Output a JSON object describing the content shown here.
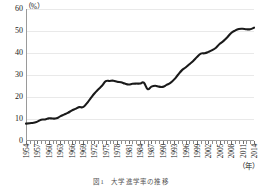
{
  "figure": {
    "unit_label": "（%）",
    "year_unit": "（年）",
    "caption": "図1　大学進学率の推移"
  },
  "chart_data": {
    "type": "line",
    "title": "図1　大学進学率の推移",
    "xlabel": "（年）",
    "ylabel": "（%）",
    "ylim": [
      0,
      60
    ],
    "xlim": [
      1954,
      2014
    ],
    "grid": true,
    "legend": "none",
    "yticks": [
      0,
      10,
      20,
      30,
      40,
      50,
      60
    ],
    "xtick_labels": [
      "1954",
      "1957",
      "1960",
      "1963",
      "1966",
      "1969",
      "1972",
      "1975",
      "1978",
      "1981",
      "1984",
      "1987",
      "1990",
      "1993",
      "1996",
      "1999",
      "2002",
      "2005",
      "2008",
      "2011",
      "2014"
    ],
    "line_color": "#1a1a1a",
    "x": [
      1954,
      1955,
      1956,
      1957,
      1958,
      1959,
      1960,
      1961,
      1962,
      1963,
      1964,
      1965,
      1966,
      1967,
      1968,
      1969,
      1970,
      1971,
      1972,
      1973,
      1974,
      1975,
      1976,
      1977,
      1978,
      1979,
      1980,
      1981,
      1982,
      1983,
      1984,
      1985,
      1986,
      1987,
      1988,
      1989,
      1990,
      1991,
      1992,
      1993,
      1994,
      1995,
      1996,
      1997,
      1998,
      1999,
      2000,
      2001,
      2002,
      2003,
      2004,
      2005,
      2006,
      2007,
      2008,
      2009,
      2010,
      2011,
      2012,
      2013,
      2014
    ],
    "values": [
      7.9,
      8.1,
      8.3,
      8.8,
      9.7,
      9.8,
      10.3,
      10.2,
      10.3,
      11.2,
      12.0,
      12.8,
      13.8,
      14.6,
      15.4,
      15.4,
      17.1,
      19.4,
      21.6,
      23.4,
      25.1,
      27.2,
      27.3,
      27.4,
      26.9,
      26.7,
      26.1,
      25.7,
      26.0,
      26.1,
      26.1,
      26.5,
      23.6,
      24.7,
      25.1,
      24.7,
      24.6,
      25.5,
      26.4,
      28.0,
      30.1,
      32.1,
      33.4,
      34.9,
      36.4,
      38.2,
      39.7,
      39.9,
      40.5,
      41.3,
      42.4,
      44.2,
      45.5,
      47.2,
      49.1,
      50.2,
      50.9,
      51.0,
      50.8,
      50.8,
      51.5
    ]
  }
}
